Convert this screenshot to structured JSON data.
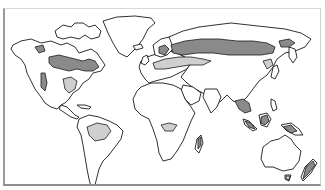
{
  "map": {
    "type": "world-map",
    "projection": "equirectangular-like",
    "colors": {
      "background": "#ffffff",
      "land": "#ffffff",
      "outline": "#1a1a1a",
      "highlight_dark": "#8a8a8a",
      "highlight_light": "#cfcfcf",
      "frame": "#9a9a9a"
    },
    "highlighted_regions": [
      {
        "name": "Canada",
        "shade": "dark"
      },
      {
        "name": "Pacific Northwest / Western US coast",
        "shade": "dark"
      },
      {
        "name": "Eastern United States",
        "shade": "light"
      },
      {
        "name": "Amazon Basin",
        "shade": "light"
      },
      {
        "name": "Scandinavia",
        "shade": "dark"
      },
      {
        "name": "Central Europe to Western Russia",
        "shade": "light"
      },
      {
        "name": "Siberia",
        "shade": "dark"
      },
      {
        "name": "Eastern Siberia",
        "shade": "dark"
      },
      {
        "name": "Northeast China / Manchuria",
        "shade": "light"
      },
      {
        "name": "Central Africa (Congo Basin)",
        "shade": "light"
      },
      {
        "name": "Southeast Asia",
        "shade": "dark"
      },
      {
        "name": "Borneo",
        "shade": "dark"
      },
      {
        "name": "Sumatra",
        "shade": "dark"
      },
      {
        "name": "New Guinea",
        "shade": "dark"
      },
      {
        "name": "Madagascar",
        "shade": "dark"
      },
      {
        "name": "Tasmania",
        "shade": "light"
      },
      {
        "name": "New Zealand",
        "shade": "dark"
      }
    ],
    "labels": []
  }
}
